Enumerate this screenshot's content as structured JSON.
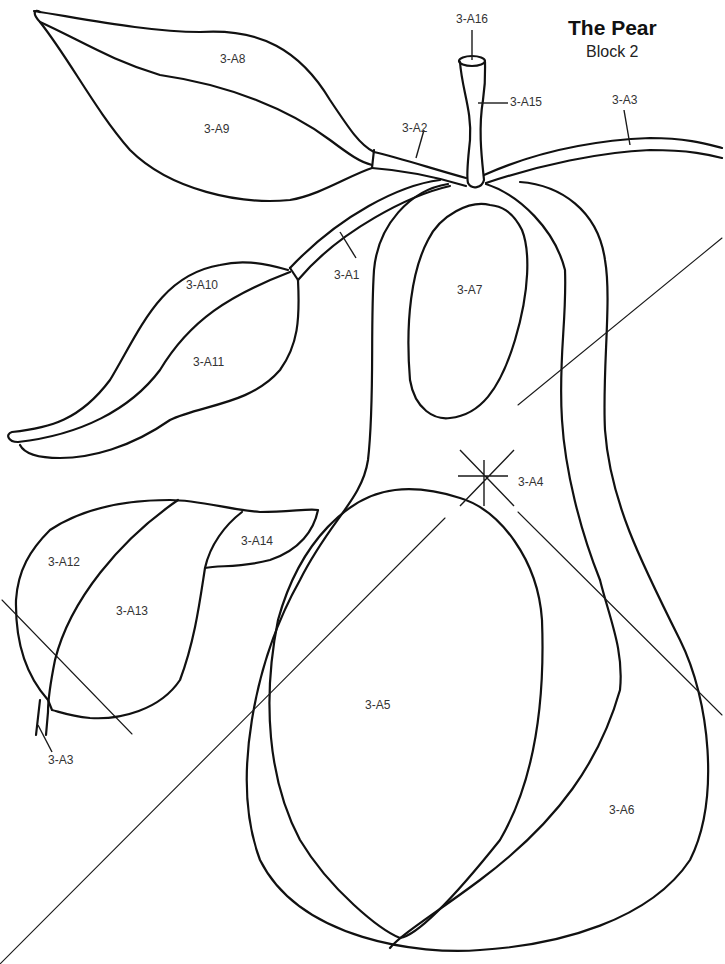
{
  "header": {
    "title": "The Pear",
    "subtitle": "Block 2"
  },
  "pieces": [
    {
      "id": "3-A1",
      "label": "3-A1",
      "part": "upper stem branch"
    },
    {
      "id": "3-A2",
      "label": "3-A2",
      "part": "stem branch to top leaf"
    },
    {
      "id": "3-A3",
      "label": "3-A3",
      "part": "right stem"
    },
    {
      "id": "3-A3b",
      "label": "3-A3",
      "part": "lower-left stem"
    },
    {
      "id": "3-A4",
      "label": "3-A4",
      "part": "pear body background"
    },
    {
      "id": "3-A5",
      "label": "3-A5",
      "part": "pear highlight large"
    },
    {
      "id": "3-A6",
      "label": "3-A6",
      "part": "pear right side"
    },
    {
      "id": "3-A7",
      "label": "3-A7",
      "part": "pear highlight small"
    },
    {
      "id": "3-A8",
      "label": "3-A8",
      "part": "top leaf upper half"
    },
    {
      "id": "3-A9",
      "label": "3-A9",
      "part": "top leaf lower half"
    },
    {
      "id": "3-A10",
      "label": "3-A10",
      "part": "middle leaf upper half"
    },
    {
      "id": "3-A11",
      "label": "3-A11",
      "part": "middle leaf lower half"
    },
    {
      "id": "3-A12",
      "label": "3-A12",
      "part": "bottom leaf left"
    },
    {
      "id": "3-A13",
      "label": "3-A13",
      "part": "bottom leaf center"
    },
    {
      "id": "3-A14",
      "label": "3-A14",
      "part": "bottom leaf tip"
    },
    {
      "id": "3-A15",
      "label": "3-A15",
      "part": "pear stem"
    },
    {
      "id": "3-A16",
      "label": "3-A16",
      "part": "stem top"
    }
  ],
  "colors": {
    "line": "#111111",
    "background": "#ffffff"
  }
}
